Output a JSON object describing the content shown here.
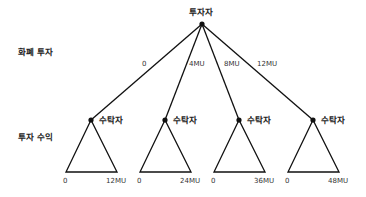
{
  "root": {
    "label": "투자자"
  },
  "row_labels": {
    "investment": "화폐 투자",
    "return": "투자 수익"
  },
  "branches": [
    {
      "edge_label": "0",
      "node_label": "수탁자",
      "payoff_low": "0",
      "payoff_high": "12MU"
    },
    {
      "edge_label": "4MU",
      "node_label": "수탁자",
      "payoff_low": "0",
      "payoff_high": "24MU"
    },
    {
      "edge_label": "8MU",
      "node_label": "수탁자",
      "payoff_low": "0",
      "payoff_high": "36MU"
    },
    {
      "edge_label": "12MU",
      "node_label": "수탁자",
      "payoff_low": "0",
      "payoff_high": "48MU"
    }
  ],
  "colors": {
    "line": "#111111",
    "text": "#222222",
    "background": "#ffffff"
  }
}
